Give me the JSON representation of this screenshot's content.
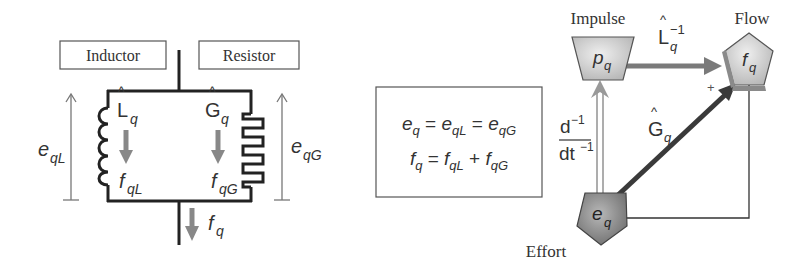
{
  "circuit": {
    "inductor_label": "Inductor",
    "resistor_label": "Resistor",
    "inductor_symbol": {
      "base": "L",
      "hat": "^",
      "sub": "q"
    },
    "resistor_symbol": {
      "base": "G",
      "hat": "^",
      "sub": "q"
    },
    "effort_left": {
      "base": "e",
      "sub": "qL"
    },
    "effort_right": {
      "base": "e",
      "sub": "qG"
    },
    "flow_inductor": {
      "base": "f",
      "sub": "qL"
    },
    "flow_resistor": {
      "base": "f",
      "sub": "qG"
    },
    "flow_total": {
      "base": "f",
      "sub": "q"
    }
  },
  "equations": {
    "line1": {
      "t1": "e",
      "s1": "q",
      "op1": " = ",
      "t2": "e",
      "s2": "qL",
      "op2": " = ",
      "t3": "e",
      "s3": "qG"
    },
    "line2": {
      "t1": "f",
      "s1": "q",
      "op1": " = ",
      "t2": "f",
      "s2": "qL",
      "op2": " + ",
      "t3": "f",
      "s3": "qG"
    }
  },
  "bond_graph": {
    "impulse_label": "Impulse",
    "flow_label": "Flow",
    "effort_label": "Effort",
    "impulse_node": {
      "base": "p",
      "sub": "q"
    },
    "flow_node": {
      "base": "f",
      "sub": "q"
    },
    "effort_node": {
      "base": "e",
      "sub": "q"
    },
    "inductance_edge": {
      "base": "L",
      "hat": "^",
      "sub": "q",
      "sup": "−1"
    },
    "conductance_edge": {
      "base": "G",
      "hat": "^",
      "sub": "q"
    },
    "integral_edge": {
      "num": "d",
      "num_sup": "−1",
      "den": "dt",
      "den_sup": "−1"
    },
    "plus_sign": "+"
  },
  "colors": {
    "wire": "#222222",
    "arrow_gray": "#888888",
    "box_border": "#555555",
    "node_light": "#d6d6d6",
    "node_dark": "#7d7d7d",
    "edge_dark": "#3a3a3a",
    "edge_mid": "#7a7a7a"
  }
}
